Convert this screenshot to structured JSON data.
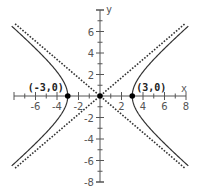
{
  "chart_data": {
    "type": "line",
    "title": "",
    "xlabel": "x",
    "ylabel": "y",
    "xlim": [
      -8,
      8
    ],
    "ylim": [
      -8,
      8
    ],
    "grid": false,
    "x_ticks": [
      -6,
      -4,
      -2,
      2,
      4,
      6,
      8
    ],
    "y_ticks": [
      -8,
      -6,
      -4,
      -2,
      2,
      4,
      6
    ],
    "x_tick_labels": [
      "-6",
      "-4",
      "-2",
      "2",
      "4",
      "6",
      "8"
    ],
    "y_tick_labels": [
      "-8",
      "-6",
      "-4",
      "-2",
      "2",
      "4",
      "6"
    ],
    "series": [
      {
        "name": "hyperbola",
        "style": "solid",
        "equation": "x^2/9 - y^2/b^2 = 1",
        "a": 3,
        "b": 2.55
      },
      {
        "name": "asymptote-positive",
        "style": "dotted",
        "slope": 0.85
      },
      {
        "name": "asymptote-negative",
        "style": "dotted",
        "slope": -0.85
      }
    ],
    "points": [
      {
        "x": -3,
        "y": 0,
        "label": "(-3,0)"
      },
      {
        "x": 3,
        "y": 0,
        "label": "(3,0)"
      },
      {
        "x": 0,
        "y": 0,
        "label": ""
      }
    ],
    "colors": {
      "curve": "#333333",
      "axis": "#555555",
      "point": "#000000"
    }
  }
}
